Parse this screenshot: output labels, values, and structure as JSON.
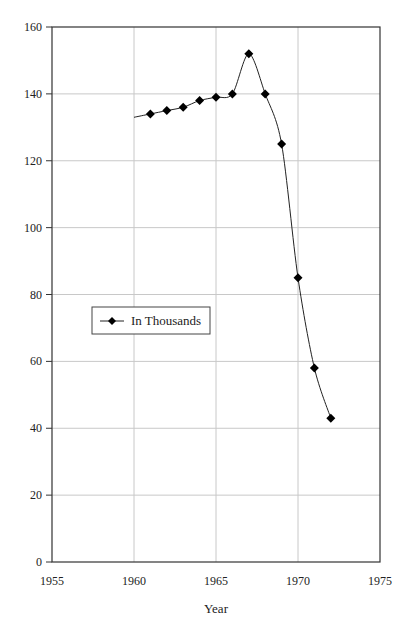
{
  "chart_data": {
    "type": "line",
    "title": "",
    "xlabel": "Year",
    "ylabel": "",
    "xlim": [
      1955,
      1975
    ],
    "ylim": [
      0,
      160
    ],
    "x_ticks": [
      1955,
      1960,
      1965,
      1970,
      1975
    ],
    "y_ticks": [
      0,
      20,
      40,
      60,
      80,
      100,
      120,
      140,
      160
    ],
    "grid": true,
    "legend_position": "left-middle",
    "series": [
      {
        "name": "In Thousands",
        "marker": "diamond",
        "color": "#000000",
        "line_start": {
          "x": 1960,
          "y": 133
        },
        "x": [
          1961,
          1962,
          1963,
          1964,
          1965,
          1966,
          1967,
          1968,
          1969,
          1970,
          1971,
          1972
        ],
        "values": [
          134,
          135,
          136,
          138,
          139,
          140,
          152,
          140,
          125,
          85,
          58,
          43
        ]
      }
    ]
  },
  "labels": {
    "x_axis_title": "Year",
    "legend": "In Thousands"
  }
}
